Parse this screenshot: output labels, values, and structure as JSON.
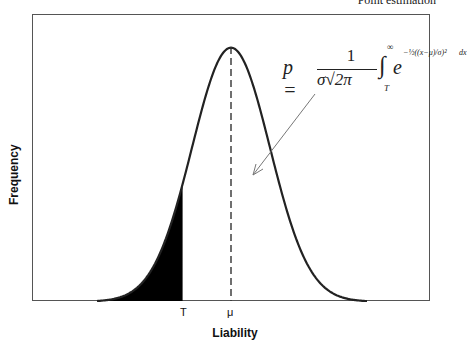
{
  "header": {
    "text": "Point estimation"
  },
  "chart_data": {
    "type": "area",
    "title": "",
    "xlabel": "Liability",
    "ylabel": "Frequency",
    "distribution": "normal",
    "x_ticks": [
      {
        "label": "T",
        "position": "threshold"
      },
      {
        "label": "μ",
        "position": "mean"
      }
    ],
    "mean_line": {
      "style": "dashed",
      "at": "μ"
    },
    "shaded_region": {
      "from": "-inf",
      "to": "T",
      "color": "#000000"
    },
    "threshold_z": -1.24,
    "annotation": {
      "formula": "p = 1/(σ√(2π)) ∫_T^∞ e^(-1/2((x-μ)/σ)^2) dx",
      "arrow_points_to": "area under curve"
    },
    "grid": false,
    "legend": null
  },
  "labels": {
    "x": "Liability",
    "y": "Frequency",
    "tick_T": "T",
    "tick_mu": "μ",
    "formula_p": "p =",
    "formula_num": "1",
    "formula_den": "σ√2π",
    "formula_upper": "∞",
    "formula_lower": "T",
    "formula_e": "e",
    "formula_exp": "−½((x−μ)/σ)²",
    "formula_dx": "dx"
  },
  "colors": {
    "curve": "#222222",
    "fill": "#000000",
    "frame": "#555555",
    "arrow": "#777777"
  }
}
